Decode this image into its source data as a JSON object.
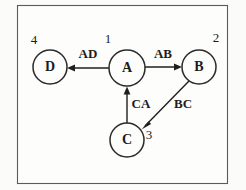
{
  "figure": {
    "kind": "directed-graph",
    "background_color": "#fbfbfa",
    "frame": {
      "x": 17,
      "y": 5,
      "width": 211,
      "height": 179,
      "stroke_color": "#5b5b5b"
    },
    "node_stroke_color": "#2b2b2b",
    "edge_stroke_color": "#1f1f1f",
    "text_color": "#1c1c1c"
  },
  "nodes": [
    {
      "id": "A",
      "label": "A",
      "index": "1",
      "cx": 127,
      "cy": 68,
      "r": 18,
      "index_x": 108,
      "index_y": 40
    },
    {
      "id": "B",
      "label": "B",
      "index": "2",
      "cx": 199,
      "cy": 67,
      "r": 17,
      "index_x": 216,
      "index_y": 39
    },
    {
      "id": "C",
      "label": "C",
      "index": "3",
      "cx": 127,
      "cy": 140,
      "r": 17,
      "index_x": 149,
      "index_y": 136
    },
    {
      "id": "D",
      "label": "D",
      "index": "4",
      "cx": 50,
      "cy": 67,
      "r": 17,
      "index_x": 34,
      "index_y": 41
    }
  ],
  "edges": [
    {
      "id": "AD",
      "label": "AD",
      "from": "A",
      "to": "D",
      "x1": 109,
      "y1": 68,
      "x2": 67,
      "y2": 68,
      "label_x": 88,
      "label_y": 55
    },
    {
      "id": "AB",
      "label": "AB",
      "from": "A",
      "to": "B",
      "x1": 145,
      "y1": 67,
      "x2": 182,
      "y2": 67,
      "label_x": 163,
      "label_y": 55
    },
    {
      "id": "BC",
      "label": "BC",
      "from": "B",
      "to": "C",
      "x1": 189,
      "y1": 81,
      "x2": 142,
      "y2": 129,
      "label_x": 183,
      "label_y": 105
    },
    {
      "id": "CA",
      "label": "CA",
      "from": "C",
      "to": "A",
      "x1": 127,
      "y1": 123,
      "x2": 127,
      "y2": 87,
      "label_x": 141,
      "label_y": 105
    }
  ]
}
